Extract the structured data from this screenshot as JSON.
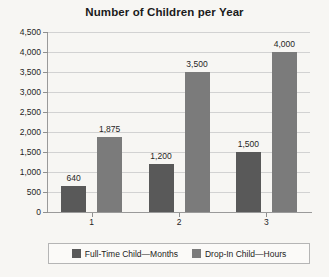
{
  "chart_data": {
    "type": "bar",
    "title": "Number of Children per Year",
    "xlabel": "",
    "ylabel": "",
    "categories": [
      "1",
      "2",
      "3"
    ],
    "series": [
      {
        "name": "Full-Time Child—Months",
        "color": "#595959",
        "values": [
          640,
          1200,
          1500
        ],
        "labels": [
          "640",
          "1,200",
          "1,500"
        ]
      },
      {
        "name": "Drop-In Child—Hours",
        "color": "#7b7b7b",
        "values": [
          1875,
          3500,
          4000
        ],
        "labels": [
          "1,875",
          "3,500",
          "4,000"
        ]
      }
    ],
    "ylim": [
      0,
      4500
    ],
    "ytick_step": 500,
    "yticks": [
      0,
      500,
      1000,
      1500,
      2000,
      2500,
      3000,
      3500,
      4000,
      4500
    ],
    "ytick_labels": [
      "0",
      "500",
      "1,000",
      "1,500",
      "2,000",
      "2,500",
      "3,000",
      "3,500",
      "4,000",
      "4,500"
    ],
    "grid": "horizontal",
    "legend_position": "bottom",
    "data_labels": true,
    "background_color": "#f7f6f3",
    "gridline_color": "#d2d2d2",
    "axis_color": "#9a9a9a"
  }
}
